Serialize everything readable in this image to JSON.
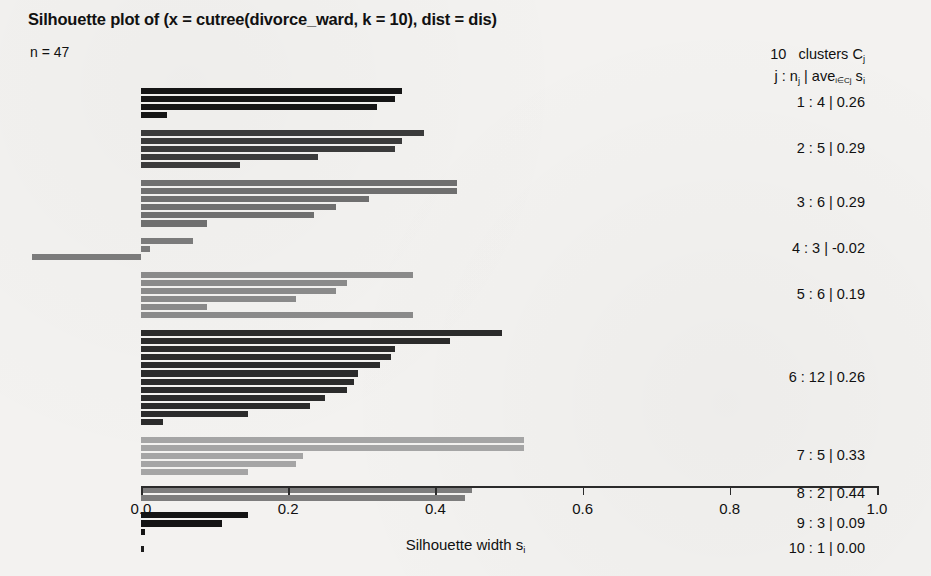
{
  "title": "Silhouette plot of (x = cutree(divorce_ward, k = 10), dist = dis)",
  "n_label": "n = 47",
  "xaxis_label_main": "Silhouette width s",
  "xaxis_label_sub": "i",
  "legend": {
    "header_count": "10",
    "header_text": "clusters C",
    "header_sub": "j",
    "line2_a": "j :  n",
    "line2_sub1": "j",
    "line2_b": " | ave",
    "line2_sub2": "i∈Cj",
    "line2_c": " s",
    "line2_sub3": "i",
    "rows": [
      {
        "label": "1 :  4  |  0.26",
        "j": 1,
        "nj": 4,
        "ave": 0.26
      },
      {
        "label": "2 :  5  |  0.29",
        "j": 2,
        "nj": 5,
        "ave": 0.29
      },
      {
        "label": "3 :  6  |  0.29",
        "j": 3,
        "nj": 6,
        "ave": 0.29
      },
      {
        "label": "4 :  3  |  -0.02",
        "j": 4,
        "nj": 3,
        "ave": -0.02
      },
      {
        "label": "5 :  6  |  0.19",
        "j": 5,
        "nj": 6,
        "ave": 0.19
      },
      {
        "label": "6 :  12  |  0.26",
        "j": 6,
        "nj": 12,
        "ave": 0.26
      },
      {
        "label": "7 :  5  |  0.33",
        "j": 7,
        "nj": 5,
        "ave": 0.33
      },
      {
        "label": "8 :  2  |  0.44",
        "j": 8,
        "nj": 2,
        "ave": 0.44
      },
      {
        "label": "9 :  3  |  0.09",
        "j": 9,
        "nj": 3,
        "ave": 0.09
      },
      {
        "label": "10 :  1  |  0.00",
        "j": 10,
        "nj": 1,
        "ave": 0.0
      }
    ]
  },
  "chart_data": {
    "type": "bar",
    "orientation": "horizontal",
    "title": "Silhouette plot of (x = cutree(divorce_ward, k = 10), dist = dis)",
    "subtitle": "n = 47",
    "xlabel": "Silhouette width s_i",
    "ylabel": "",
    "xlim": [
      -0.2,
      1.0
    ],
    "axis_ticks": [
      "0.0",
      "0.2",
      "0.4",
      "0.6",
      "0.8",
      "1.0"
    ],
    "axis_tick_values": [
      0.0,
      0.2,
      0.4,
      0.6,
      0.8,
      1.0
    ],
    "grid": false,
    "legend_position": "right",
    "n_total": 47,
    "n_clusters": 10,
    "clusters": [
      {
        "j": 1,
        "n": 4,
        "ave": 0.26,
        "color": "#151515",
        "values": [
          0.355,
          0.345,
          0.32,
          0.035
        ]
      },
      {
        "j": 2,
        "n": 5,
        "ave": 0.29,
        "color": "#3b3b3b",
        "values": [
          0.385,
          0.355,
          0.345,
          0.24,
          0.135
        ]
      },
      {
        "j": 3,
        "n": 6,
        "ave": 0.29,
        "color": "#6f6f6f",
        "values": [
          0.43,
          0.43,
          0.31,
          0.265,
          0.235,
          0.09
        ]
      },
      {
        "j": 4,
        "n": 3,
        "ave": -0.02,
        "color": "#7b7b7b",
        "values": [
          0.07,
          0.012,
          -0.148
        ]
      },
      {
        "j": 5,
        "n": 6,
        "ave": 0.19,
        "color": "#8a8a8a",
        "values": [
          0.37,
          0.28,
          0.265,
          0.21,
          0.09,
          0.37
        ]
      },
      {
        "j": 6,
        "n": 12,
        "ave": 0.26,
        "color": "#2b2b2b",
        "values": [
          0.49,
          0.42,
          0.345,
          0.34,
          0.325,
          0.295,
          0.29,
          0.28,
          0.25,
          0.23,
          0.145,
          0.03
        ]
      },
      {
        "j": 7,
        "n": 5,
        "ave": 0.33,
        "color": "#a5a5a5",
        "values": [
          0.52,
          0.52,
          0.22,
          0.21,
          0.145
        ]
      },
      {
        "j": 8,
        "n": 2,
        "ave": 0.44,
        "color": "#7d7d7d",
        "values": [
          0.45,
          0.44
        ]
      },
      {
        "j": 9,
        "n": 3,
        "ave": 0.09,
        "color": "#141414",
        "values": [
          0.145,
          0.11,
          0.006
        ]
      },
      {
        "j": 10,
        "n": 1,
        "ave": 0.0,
        "color": "#1d1d1d",
        "values": [
          0.004
        ]
      }
    ]
  }
}
